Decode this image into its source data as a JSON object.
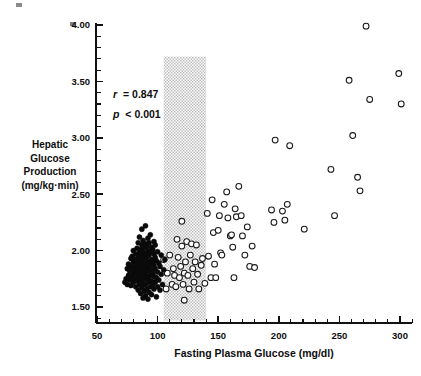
{
  "chart_data": {
    "type": "scatter",
    "title": "",
    "xlabel": "Fasting Plasma Glucose (mg/dl)",
    "ylabel": "Hepatic Glucose Production (mg/kg·min)",
    "ylabel_lines": [
      "Hepatic",
      "Glucose",
      "Production",
      "(mg/kg·min)"
    ],
    "xlim": [
      50,
      312
    ],
    "ylim": [
      1.38,
      4.0
    ],
    "xticks": [
      50,
      100,
      150,
      200,
      250,
      300
    ],
    "xtick_labels": [
      "50",
      "100",
      "150",
      "200",
      "250",
      "300"
    ],
    "xtick_minor_step": 10,
    "yticks": [
      1.5,
      2.0,
      2.5,
      3.0,
      3.5,
      4.0
    ],
    "ytick_labels": [
      "1.50",
      "2.00",
      "2.50",
      "3.00",
      "3.50",
      "4.00"
    ],
    "ytick_minor_step": 0.1,
    "grid": false,
    "legend_position": "none",
    "annotations": [
      {
        "name": "correlation",
        "symbol": "r",
        "relation": "=",
        "value": "0.847",
        "text": "r = 0.847",
        "x": 88,
        "y": 3.42
      },
      {
        "name": "p-value",
        "symbol": "p",
        "relation": "<",
        "value": "0.001",
        "text": "p < 0.001",
        "x": 88,
        "y": 3.25
      }
    ],
    "shaded_band": {
      "name": "normal-range-band",
      "x_start": 105,
      "x_end": 140,
      "y_start": 1.38,
      "y_end": 3.72,
      "color": "#b9b9b9",
      "pattern": "stipple"
    },
    "series": [
      {
        "name": "Normal subjects",
        "marker": "filled-circle",
        "color": "#0a0a0a",
        "points": [
          [
            73,
            1.72
          ],
          [
            74,
            1.75
          ],
          [
            75,
            1.7
          ],
          [
            75,
            1.84
          ],
          [
            76,
            1.78
          ],
          [
            76,
            1.88
          ],
          [
            77,
            1.74
          ],
          [
            77,
            1.82
          ],
          [
            78,
            1.69
          ],
          [
            78,
            1.86
          ],
          [
            78,
            1.93
          ],
          [
            79,
            1.77
          ],
          [
            79,
            1.85
          ],
          [
            79,
            1.95
          ],
          [
            80,
            1.72
          ],
          [
            80,
            1.8
          ],
          [
            80,
            1.9
          ],
          [
            80,
            2.0
          ],
          [
            81,
            1.75
          ],
          [
            81,
            1.83
          ],
          [
            81,
            1.92
          ],
          [
            82,
            1.68
          ],
          [
            82,
            1.79
          ],
          [
            82,
            1.87
          ],
          [
            82,
            1.97
          ],
          [
            83,
            1.73
          ],
          [
            83,
            1.82
          ],
          [
            83,
            1.91
          ],
          [
            83,
            2.02
          ],
          [
            84,
            1.65
          ],
          [
            84,
            1.76
          ],
          [
            84,
            1.85
          ],
          [
            84,
            1.94
          ],
          [
            84,
            2.07
          ],
          [
            85,
            1.7
          ],
          [
            85,
            1.8
          ],
          [
            85,
            1.88
          ],
          [
            85,
            1.98
          ],
          [
            85,
            2.12
          ],
          [
            86,
            1.62
          ],
          [
            86,
            1.74
          ],
          [
            86,
            1.83
          ],
          [
            86,
            1.92
          ],
          [
            86,
            2.01
          ],
          [
            87,
            1.67
          ],
          [
            87,
            1.78
          ],
          [
            87,
            1.86
          ],
          [
            87,
            1.95
          ],
          [
            87,
            2.05
          ],
          [
            87,
            2.19
          ],
          [
            88,
            1.58
          ],
          [
            88,
            1.71
          ],
          [
            88,
            1.81
          ],
          [
            88,
            1.89
          ],
          [
            88,
            1.99
          ],
          [
            88,
            2.09
          ],
          [
            89,
            1.64
          ],
          [
            89,
            1.75
          ],
          [
            89,
            1.84
          ],
          [
            89,
            1.93
          ],
          [
            89,
            2.03
          ],
          [
            90,
            1.6
          ],
          [
            90,
            1.7
          ],
          [
            90,
            1.79
          ],
          [
            90,
            1.88
          ],
          [
            90,
            1.97
          ],
          [
            90,
            2.06
          ],
          [
            90,
            2.22
          ],
          [
            91,
            1.66
          ],
          [
            91,
            1.76
          ],
          [
            91,
            1.85
          ],
          [
            91,
            1.94
          ],
          [
            91,
            2.04
          ],
          [
            92,
            1.57
          ],
          [
            92,
            1.72
          ],
          [
            92,
            1.82
          ],
          [
            92,
            1.9
          ],
          [
            92,
            2.0
          ],
          [
            92,
            2.11
          ],
          [
            93,
            1.63
          ],
          [
            93,
            1.74
          ],
          [
            93,
            1.86
          ],
          [
            93,
            1.96
          ],
          [
            93,
            2.07
          ],
          [
            94,
            1.68
          ],
          [
            94,
            1.78
          ],
          [
            94,
            1.88
          ],
          [
            94,
            1.99
          ],
          [
            94,
            2.14
          ],
          [
            95,
            1.61
          ],
          [
            95,
            1.73
          ],
          [
            95,
            1.83
          ],
          [
            95,
            1.92
          ],
          [
            95,
            2.03
          ],
          [
            96,
            1.7
          ],
          [
            96,
            1.8
          ],
          [
            96,
            1.9
          ],
          [
            96,
            2.01
          ],
          [
            97,
            1.66
          ],
          [
            97,
            1.77
          ],
          [
            97,
            1.87
          ],
          [
            97,
            1.97
          ],
          [
            97,
            2.08
          ],
          [
            98,
            1.72
          ],
          [
            98,
            1.84
          ],
          [
            98,
            1.94
          ],
          [
            98,
            2.05
          ],
          [
            99,
            1.59
          ],
          [
            99,
            1.76
          ],
          [
            99,
            1.91
          ],
          [
            100,
            1.68
          ],
          [
            100,
            1.81
          ],
          [
            100,
            1.99
          ],
          [
            101,
            1.74
          ],
          [
            101,
            1.89
          ],
          [
            102,
            1.65
          ],
          [
            102,
            1.86
          ],
          [
            103,
            1.79
          ],
          [
            103,
            1.96
          ],
          [
            104,
            1.7
          ],
          [
            105,
            1.83
          ],
          [
            106,
            1.92
          ]
        ]
      },
      {
        "name": "Diabetic subjects",
        "marker": "open-circle",
        "color": "#1a1a1a",
        "points": [
          [
            105,
            1.92
          ],
          [
            107,
            1.66
          ],
          [
            108,
            1.8
          ],
          [
            110,
            1.96
          ],
          [
            112,
            1.7
          ],
          [
            113,
            1.84
          ],
          [
            114,
            1.78
          ],
          [
            115,
            1.68
          ],
          [
            116,
            2.1
          ],
          [
            117,
            1.94
          ],
          [
            118,
            1.76
          ],
          [
            119,
            1.86
          ],
          [
            120,
            2.26
          ],
          [
            120,
            2.04
          ],
          [
            121,
            1.7
          ],
          [
            122,
            1.8
          ],
          [
            122,
            1.56
          ],
          [
            123,
            1.9
          ],
          [
            124,
            2.08
          ],
          [
            125,
            1.78
          ],
          [
            126,
            1.66
          ],
          [
            127,
            1.96
          ],
          [
            128,
            2.06
          ],
          [
            129,
            1.84
          ],
          [
            130,
            1.72
          ],
          [
            131,
            1.9
          ],
          [
            132,
            2.05
          ],
          [
            133,
            1.79
          ],
          [
            134,
            1.66
          ],
          [
            136,
            1.87
          ],
          [
            137,
            1.93
          ],
          [
            139,
            1.71
          ],
          [
            141,
            2.33
          ],
          [
            142,
            1.95
          ],
          [
            144,
            1.76
          ],
          [
            145,
            2.45
          ],
          [
            146,
            2.16
          ],
          [
            147,
            1.88
          ],
          [
            148,
            1.76
          ],
          [
            150,
            2.18
          ],
          [
            151,
            2.31
          ],
          [
            152,
            1.98
          ],
          [
            153,
            1.96
          ],
          [
            155,
            2.41
          ],
          [
            157,
            2.52
          ],
          [
            158,
            2.29
          ],
          [
            160,
            2.13
          ],
          [
            161,
            2.14
          ],
          [
            162,
            2.03
          ],
          [
            163,
            1.76
          ],
          [
            164,
            2.37
          ],
          [
            165,
            2.3
          ],
          [
            167,
            2.57
          ],
          [
            169,
            2.31
          ],
          [
            170,
            2.13
          ],
          [
            172,
            1.96
          ],
          [
            174,
            2.21
          ],
          [
            176,
            1.86
          ],
          [
            178,
            2.04
          ],
          [
            180,
            1.85
          ],
          [
            194,
            2.36
          ],
          [
            196,
            2.25
          ],
          [
            197,
            2.98
          ],
          [
            203,
            2.35
          ],
          [
            205,
            2.27
          ],
          [
            207,
            2.41
          ],
          [
            209,
            2.93
          ],
          [
            221,
            2.19
          ],
          [
            243,
            2.72
          ],
          [
            246,
            2.31
          ],
          [
            258,
            3.51
          ],
          [
            261,
            3.02
          ],
          [
            265,
            2.65
          ],
          [
            267,
            2.53
          ],
          [
            272,
            3.99
          ],
          [
            275,
            3.34
          ],
          [
            299,
            3.57
          ],
          [
            301,
            3.3
          ]
        ]
      }
    ]
  },
  "figure": {
    "name": "scatter-figure"
  }
}
